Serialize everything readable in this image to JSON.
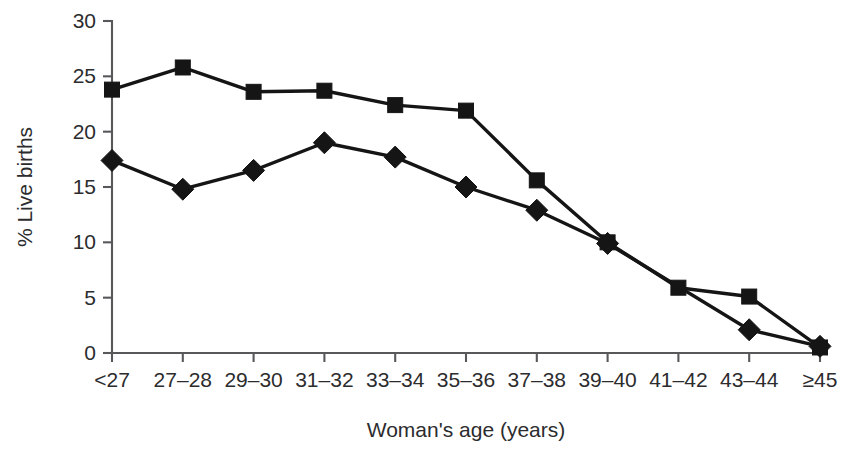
{
  "chart_data": {
    "type": "line",
    "title": "",
    "xlabel": "Woman's age (years)",
    "ylabel": "% Live births",
    "categories": [
      "<27",
      "27–28",
      "29–30",
      "31–32",
      "33–34",
      "35–36",
      "37–38",
      "39–40",
      "41–42",
      "43–44",
      "≥45"
    ],
    "series": [
      {
        "name": "square-series",
        "marker": "square",
        "values": [
          23.8,
          25.8,
          23.6,
          23.7,
          22.4,
          21.9,
          15.6,
          10.0,
          5.9,
          5.1,
          0.5
        ]
      },
      {
        "name": "diamond-series",
        "marker": "diamond",
        "values": [
          17.4,
          14.8,
          16.5,
          19.0,
          17.7,
          15.0,
          12.9,
          9.9,
          null,
          2.1,
          0.6
        ]
      }
    ],
    "ylim": [
      0,
      30
    ],
    "yticks": [
      0,
      5,
      10,
      15,
      20,
      25,
      30
    ],
    "ytick_labels": [
      "0",
      "5",
      "10",
      "15",
      "20",
      "25",
      "30"
    ],
    "grid": false,
    "legend": "none",
    "colors": {
      "series": "#151515",
      "axis": "#58585a",
      "text": "#2c2c2e",
      "background": "#ffffff"
    }
  }
}
